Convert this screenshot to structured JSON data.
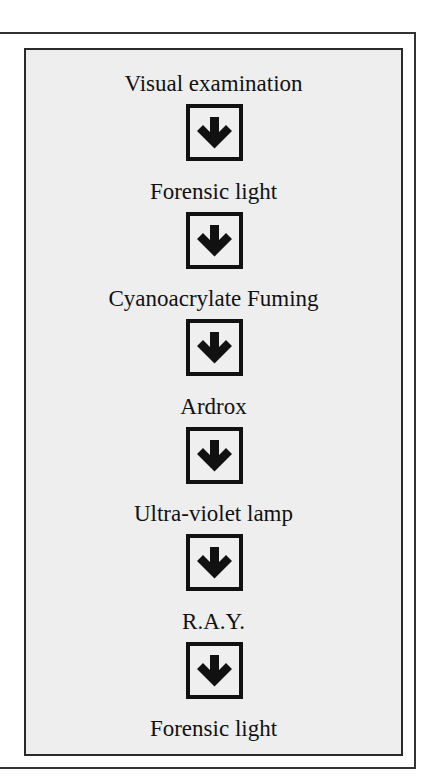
{
  "diagram": {
    "type": "vertical-flowchart",
    "steps": [
      {
        "label": "Visual examination"
      },
      {
        "label": "Forensic light"
      },
      {
        "label": "Cyanoacrylate Fuming"
      },
      {
        "label": "Ardrox"
      },
      {
        "label": "Ultra-violet lamp"
      },
      {
        "label": "R.A.Y."
      },
      {
        "label": "Forensic light"
      }
    ],
    "connector_icon": "down-arrow-icon",
    "colors": {
      "panel_background": "#eeeeee",
      "border": "#222222",
      "text": "#111111"
    }
  }
}
